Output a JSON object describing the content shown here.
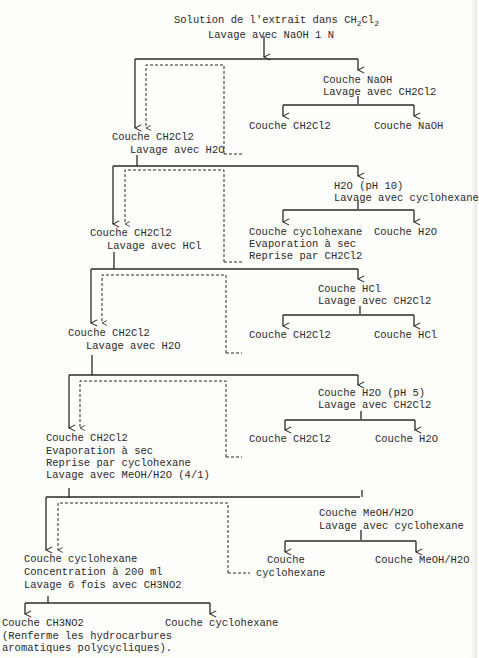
{
  "diagram": {
    "title": "Solution de l'extrait dans CH2Cl2",
    "nodes": {
      "start": {
        "line1": "Solution de l'extrait dans CH",
        "line1_sub1": "2",
        "line1_mid": "Cl",
        "line1_sub2": "2",
        "line2": "Lavage avec NaOH 1 N"
      },
      "s1_left": {
        "line1": "Couche CH2Cl2",
        "line2": "Lavage avec H2O"
      },
      "s1_right": {
        "line1": "Couche NaOH",
        "line2": "Lavage avec CH2Cl2"
      },
      "s1_right_a": {
        "line1": "Couche CH2Cl2"
      },
      "s1_right_b": {
        "line1": "Couche NaOH"
      },
      "s2_left": {
        "line1": "Couche CH2Cl2",
        "line2": "Lavage avec HCl"
      },
      "s2_right": {
        "line1": "H2O (pH 10)",
        "line2": "Lavage avec cyclohexane"
      },
      "s2_right_a": {
        "line1": "Couche cyclohexane",
        "line2": "Evaporation à sec",
        "line3": "Reprise par CH2Cl2"
      },
      "s2_right_b": {
        "line1": "Couche H2O"
      },
      "s3_left": {
        "line1": "Couche CH2Cl2",
        "line2": "Lavage avec H2O"
      },
      "s3_right": {
        "line1": "Couche HCl",
        "line2": "Lavage avec CH2Cl2"
      },
      "s3_right_a": {
        "line1": "Couche CH2Cl2"
      },
      "s3_right_b": {
        "line1": "Couche HCl"
      },
      "s4_left": {
        "line1": "Couche CH2Cl2",
        "line2": "Evaporation à sec",
        "line3": "Reprise par cyclohexane",
        "line4": "Lavage avec MeOH/H2O (4/1)"
      },
      "s4_right": {
        "line1": "Couche H2O (pH 5)",
        "line2": "Lavage avec CH2Cl2"
      },
      "s4_right_a": {
        "line1": "Couche CH2Cl2"
      },
      "s4_right_b": {
        "line1": "Couche H2O"
      },
      "s5_left": {
        "line1": "Couche cyclohexane",
        "line2": "Concentration à 200 ml",
        "line3": "Lavage 6 fois avec CH3NO2"
      },
      "s5_right": {
        "line1": "Couche MeOH/H2O",
        "line2": "Lavage avec cyclohexane"
      },
      "s5_right_a": {
        "line1": "Couche",
        "line2": "cyclohexane"
      },
      "s5_right_b": {
        "line1": "Couche MeOH/H2O"
      },
      "final_left": {
        "line1": "Couche CH3NO2",
        "line2": "(Renferme les hydrocarbures",
        "line3": "aromatiques polycycliques)."
      },
      "final_right": {
        "line1": "Couche cyclohexane"
      }
    },
    "colors": {
      "ink": "#2a2a2a",
      "paper": "#fdfdfb"
    }
  }
}
